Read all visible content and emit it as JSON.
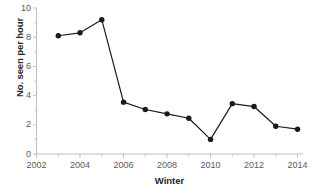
{
  "chart_data": {
    "type": "line",
    "title": "",
    "xlabel": "Winter",
    "ylabel": "No. seen per hour",
    "x": [
      2003,
      2004,
      2005,
      2006,
      2007,
      2008,
      2009,
      2010,
      2011,
      2012,
      2013,
      2014
    ],
    "values": [
      8.1,
      8.3,
      9.2,
      3.55,
      3.05,
      2.75,
      2.45,
      1.0,
      3.45,
      3.25,
      1.9,
      1.7
    ],
    "series": [
      {
        "name": "No. seen per hour",
        "values": [
          8.1,
          8.3,
          9.2,
          3.55,
          3.05,
          2.75,
          2.45,
          1.0,
          3.45,
          3.25,
          1.9,
          1.7
        ]
      }
    ],
    "xlim": [
      2002,
      2014.25
    ],
    "ylim": [
      0,
      10
    ],
    "ytick_labels": [
      "0",
      "2",
      "4",
      "6",
      "8",
      "10"
    ],
    "ytick_values": [
      0,
      2,
      4,
      6,
      8,
      10
    ],
    "yminor_values": [
      1,
      3,
      5,
      7,
      9
    ],
    "xtick_labels": [
      "2002",
      "2004",
      "2006",
      "2008",
      "2010",
      "2012",
      "2014"
    ],
    "xtick_values": [
      2002,
      2004,
      2006,
      2008,
      2010,
      2012,
      2014
    ],
    "xminor_values": [
      2003,
      2005,
      2007,
      2009,
      2011,
      2013
    ],
    "grid": false,
    "legend": false,
    "legend_position": "none",
    "marker": "filled-circle",
    "line_color": "#1a1a1a",
    "marker_color": "#1a1a1a",
    "axis_color": "#bfbfbf",
    "tick_text_color": "#5a5a5a",
    "label_text_color": "#262626",
    "background": "#ffffff"
  }
}
